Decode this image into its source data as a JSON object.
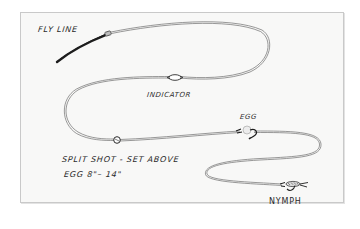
{
  "diagram": {
    "type": "hand-drawn nymph fishing rig illustration",
    "colors": {
      "paper": "#f8f8f7",
      "frame": "#c9c9c9",
      "ink": "#2a2a2a",
      "line": "#7a7a7a"
    },
    "labels": {
      "fly_line": "FLY LINE",
      "indicator": "INDICATOR",
      "egg": "EGG",
      "split_shot_line1": "SPLIT SHOT - SET ABOVE",
      "split_shot_line2": "EGG  8\"– 14\"",
      "nymph": "NYMPH"
    },
    "components": [
      {
        "name": "fly line",
        "order": 1
      },
      {
        "name": "indicator",
        "order": 2
      },
      {
        "name": "split shot",
        "order": 3,
        "note": "set above egg 8\"–14\""
      },
      {
        "name": "egg",
        "order": 4
      },
      {
        "name": "nymph",
        "order": 5
      }
    ]
  }
}
